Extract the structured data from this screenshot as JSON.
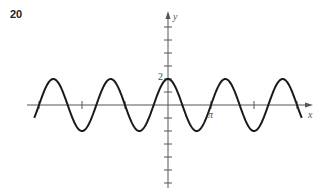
{
  "problem_number": "20",
  "chart_data": {
    "type": "line",
    "title": "",
    "function": "y = 2cos(3x/2)",
    "amplitude": 2,
    "angular_frequency": 1.5,
    "xlabel": "x",
    "ylabel": "y",
    "xlim": [
      -3.1,
      3.1
    ],
    "xlim_units": "multiples of pi",
    "ylim": [
      -6.5,
      7
    ],
    "x_ticks": [
      -3,
      -2,
      -1,
      1,
      2,
      3
    ],
    "x_tick_labels": [
      {
        "value": 1,
        "label": "π"
      }
    ],
    "y_ticks": [
      -6,
      -5,
      -4,
      -3,
      -2,
      -1,
      1,
      2,
      3,
      4,
      5,
      6
    ],
    "y_tick_labels": [
      {
        "value": 2,
        "label": "2"
      }
    ],
    "curve_x_range": [
      -3.11,
      3.11
    ],
    "grid": false,
    "legend": "none"
  }
}
